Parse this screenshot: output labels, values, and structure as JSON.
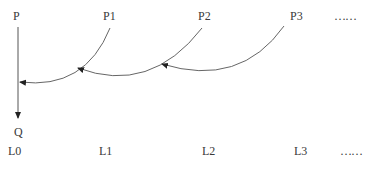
{
  "diagram": {
    "top_labels": [
      {
        "text": "P",
        "x": 13,
        "y": 10
      },
      {
        "text": "P1",
        "x": 103,
        "y": 10
      },
      {
        "text": "P2",
        "x": 198,
        "y": 10
      },
      {
        "text": "P3",
        "x": 290,
        "y": 10
      },
      {
        "text": "……",
        "x": 334,
        "y": 10
      }
    ],
    "bottom_labels": [
      {
        "text": "L0",
        "x": 8,
        "y": 145
      },
      {
        "text": "L1",
        "x": 99,
        "y": 145
      },
      {
        "text": "L2",
        "x": 202,
        "y": 145
      },
      {
        "text": "L3",
        "x": 294,
        "y": 145
      },
      {
        "text": "……",
        "x": 340,
        "y": 145
      }
    ],
    "q_label": {
      "text": "Q",
      "x": 14,
      "y": 126
    },
    "stroke_color": "#555555"
  }
}
